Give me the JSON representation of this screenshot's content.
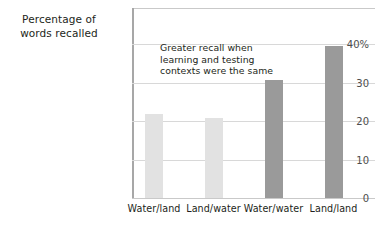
{
  "chart_data": {
    "type": "bar",
    "title": "Percentage of words recalled",
    "title_lines": [
      "Percentage of",
      "words recalled"
    ],
    "xlabel": "",
    "ylabel": "Percentage of words recalled",
    "categories": [
      "Water/land",
      "Land/water",
      "Water/water",
      "Land/land"
    ],
    "values": [
      21.7,
      20.8,
      30.6,
      39.5
    ],
    "series": [
      {
        "name": "Percentage of words recalled",
        "values": [
          21.7,
          20.8,
          30.6,
          39.5
        ]
      }
    ],
    "bar_colors": [
      "#e2e2e2",
      "#e2e2e2",
      "#9a9a9a",
      "#9a9a9a"
    ],
    "ylim": [
      0,
      44
    ],
    "yticks": [
      0,
      10,
      20,
      30,
      40
    ],
    "ytick_labels": [
      "0",
      "10",
      "20",
      "30",
      "40%"
    ],
    "grid": true,
    "grid_axis": "y",
    "legend": false,
    "annotations": [
      {
        "text": "Greater recall when learning and testing contexts were the same",
        "lines": [
          "Greater recall when",
          "learning and testing",
          "contexts were the same"
        ]
      }
    ]
  },
  "colors": {
    "light_bar": "#e2e2e2",
    "dark_bar": "#9a9a9a",
    "axis": "#a7a7a7",
    "grid": "#d8d8d8",
    "text": "#231f20",
    "tick_text": "#4d4d4d",
    "background": "#ffffff"
  }
}
